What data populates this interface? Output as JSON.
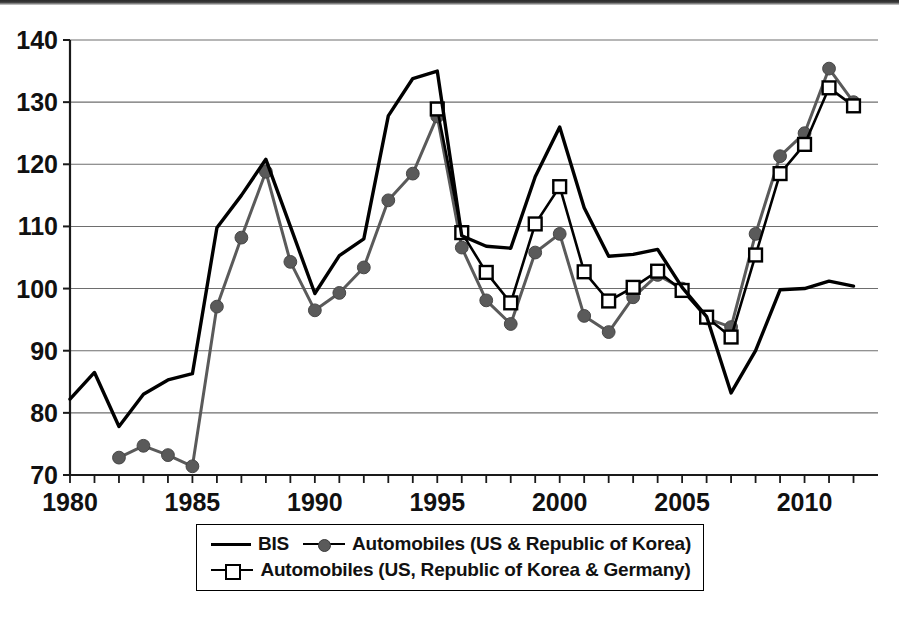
{
  "chart_data": {
    "type": "line",
    "title": "",
    "subtitle": "",
    "xlabel": "",
    "ylabel": "",
    "xlim": [
      1980,
      2012
    ],
    "ylim": [
      70,
      140
    ],
    "y_ticks": [
      70,
      80,
      90,
      100,
      110,
      120,
      130,
      140
    ],
    "x_ticks_labeled": [
      1980,
      1985,
      1990,
      1995,
      2000,
      2005,
      2010
    ],
    "x_tick_step": 1,
    "grid": "horizontal",
    "legend_position": "bottom",
    "x": [
      1980,
      1981,
      1982,
      1983,
      1984,
      1985,
      1986,
      1987,
      1988,
      1989,
      1990,
      1991,
      1992,
      1993,
      1994,
      1995,
      1996,
      1997,
      1998,
      1999,
      2000,
      2001,
      2002,
      2003,
      2004,
      2005,
      2006,
      2007,
      2008,
      2009,
      2010,
      2011,
      2012
    ],
    "series": [
      {
        "name": "BIS",
        "marker": "none",
        "line_style": "solid",
        "color": "#000000",
        "values": [
          82.2,
          86.5,
          77.8,
          83.0,
          85.3,
          86.3,
          109.8,
          115.0,
          120.8,
          110.0,
          99.2,
          105.3,
          108.0,
          127.8,
          133.8,
          135.0,
          108.5,
          106.8,
          106.5,
          118.0,
          126.0,
          113.0,
          105.2,
          105.5,
          106.3,
          100.2,
          95.5,
          83.2,
          90.0,
          99.8,
          100.0,
          101.2,
          100.4
        ]
      },
      {
        "name": "Automobiles (US & Republic of Korea)",
        "marker": "filled-circle",
        "line_style": "solid",
        "color": "#5a5a5a",
        "values": [
          null,
          null,
          72.8,
          74.7,
          73.2,
          71.4,
          97.1,
          108.2,
          118.8,
          104.3,
          96.5,
          99.3,
          103.4,
          114.2,
          118.5,
          127.7,
          106.6,
          98.1,
          94.3,
          105.8,
          108.8,
          95.6,
          93.0,
          98.6,
          102.2,
          100.0,
          95.2,
          93.8,
          108.8,
          121.3,
          125.0,
          135.4,
          130.0
        ]
      },
      {
        "name": "Automobiles (US, Republic of Korea & Germany)",
        "marker": "open-square",
        "line_style": "solid",
        "color": "#000000",
        "values": [
          null,
          null,
          null,
          null,
          null,
          null,
          null,
          null,
          null,
          null,
          null,
          null,
          null,
          null,
          null,
          128.9,
          109.0,
          102.6,
          97.7,
          110.4,
          116.4,
          102.7,
          98.0,
          100.2,
          102.8,
          99.7,
          95.4,
          92.2,
          105.4,
          118.5,
          123.2,
          132.3,
          129.4
        ]
      }
    ]
  },
  "legend": {
    "items": [
      {
        "label": "BIS",
        "key": "plain-line"
      },
      {
        "label": "Automobiles (US & Republic of Korea)",
        "key": "circle-line"
      },
      {
        "label": "Automobiles (US, Republic of Korea & Germany)",
        "key": "square-line"
      }
    ]
  },
  "axes": {
    "y_tick_labels": [
      "140",
      "130",
      "120",
      "110",
      "100",
      "90",
      "80",
      "70"
    ],
    "x_tick_labels": [
      "1980",
      "1985",
      "1990",
      "1995",
      "2000",
      "2005",
      "2010"
    ]
  },
  "colors": {
    "bis_line": "#000000",
    "auto_us_kr_line": "#5a5a5a",
    "auto_us_kr_de_line": "#000000",
    "gridline": "#6e6e6e",
    "axis": "#1a1a1a",
    "background": "#ffffff"
  }
}
